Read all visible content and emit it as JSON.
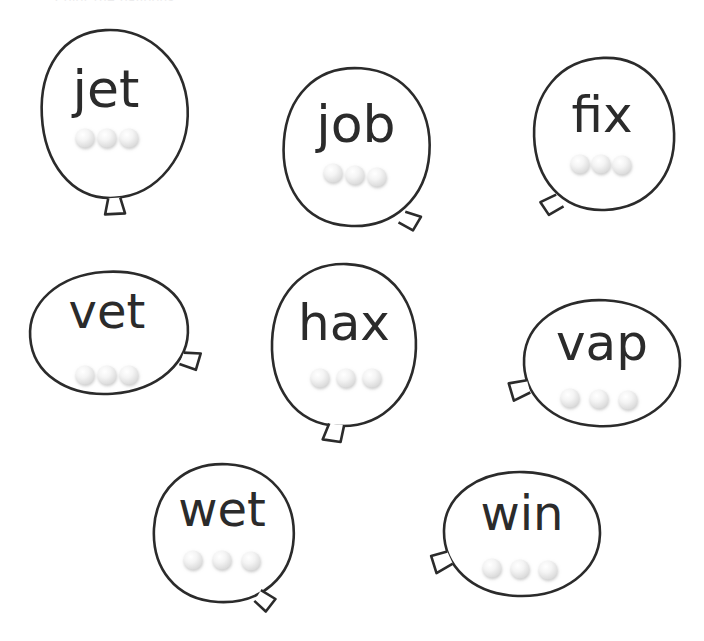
{
  "worksheet": {
    "title_partial": "Color the balloons",
    "background_color": "#ffffff",
    "outline_color": "#2b2b2b",
    "text_color": "#2b2b2b",
    "dot_color": "#ededed",
    "dot_count_per_balloon": 3,
    "balloon_count": 8
  },
  "balloons": [
    {
      "id": "balloon-jet",
      "word": "jet",
      "row": 1,
      "column": 1,
      "knot_position": "bottom",
      "dots": 3
    },
    {
      "id": "balloon-job",
      "word": "job",
      "row": 1,
      "column": 2,
      "knot_position": "bottom-right",
      "dots": 3
    },
    {
      "id": "balloon-fix",
      "word": "fix",
      "row": 1,
      "column": 3,
      "knot_position": "bottom-left",
      "dots": 3
    },
    {
      "id": "balloon-vet",
      "word": "vet",
      "row": 2,
      "column": 1,
      "knot_position": "right",
      "dots": 3
    },
    {
      "id": "balloon-hax",
      "word": "hax",
      "row": 2,
      "column": 2,
      "knot_position": "bottom",
      "dots": 3
    },
    {
      "id": "balloon-vap",
      "word": "vap",
      "row": 2,
      "column": 3,
      "knot_position": "left",
      "dots": 3
    },
    {
      "id": "balloon-wet",
      "word": "wet",
      "row": 3,
      "column": 1,
      "knot_position": "bottom-right",
      "dots": 3
    },
    {
      "id": "balloon-win",
      "word": "win",
      "row": 3,
      "column": 2,
      "knot_position": "left",
      "dots": 3
    }
  ]
}
